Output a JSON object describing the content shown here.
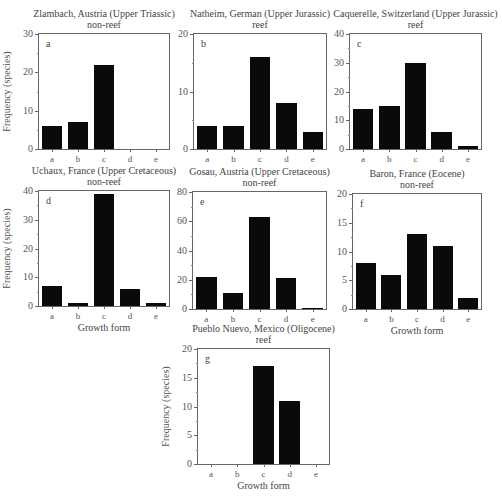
{
  "chart_data": [
    {
      "id": "a",
      "type": "bar",
      "title": "Zlambach, Austria (Upper Triassic)",
      "subtitle": "non-reef",
      "panel_label": "a",
      "categories": [
        "a",
        "b",
        "c",
        "d",
        "e"
      ],
      "values": [
        6,
        7,
        22,
        0,
        0
      ],
      "ylim": [
        0,
        30
      ],
      "yticks": [
        0,
        10,
        20,
        30
      ],
      "minor_step": 5,
      "xlabel": "",
      "ylabel": "Frequency (species)",
      "box": {
        "left": 38,
        "top": 33,
        "width": 132,
        "height": 117
      }
    },
    {
      "id": "b",
      "type": "bar",
      "title": "Natheim, German (Upper Jurassic)",
      "subtitle": "reef",
      "panel_label": "b",
      "categories": [
        "a",
        "b",
        "c",
        "d",
        "e"
      ],
      "values": [
        4,
        4,
        16,
        8,
        3
      ],
      "ylim": [
        0,
        20
      ],
      "yticks": [
        0,
        10,
        20
      ],
      "minor_step": 5,
      "xlabel": "",
      "ylabel": "",
      "box": {
        "left": 193,
        "top": 33,
        "width": 134,
        "height": 117
      }
    },
    {
      "id": "c",
      "type": "bar",
      "title": "Caquerelle, Switzerland (Upper Jurassic)",
      "subtitle": "reef",
      "panel_label": "c",
      "categories": [
        "a",
        "b",
        "c",
        "d",
        "e"
      ],
      "values": [
        14,
        15,
        30,
        6,
        1
      ],
      "ylim": [
        0,
        40
      ],
      "yticks": [
        0,
        10,
        20,
        30,
        40
      ],
      "minor_step": 5,
      "xlabel": "",
      "ylabel": "",
      "box": {
        "left": 349,
        "top": 33,
        "width": 133,
        "height": 117
      }
    },
    {
      "id": "d",
      "type": "bar",
      "title": "Uchaux, France (Upper Cretaceous)",
      "subtitle": "non-reef",
      "panel_label": "d",
      "categories": [
        "a",
        "b",
        "c",
        "d",
        "e"
      ],
      "values": [
        7,
        1,
        39,
        6,
        1
      ],
      "ylim": [
        0,
        40
      ],
      "yticks": [
        0,
        10,
        20,
        30,
        40
      ],
      "minor_step": 5,
      "xlabel": "Growth form",
      "ylabel": "Frequency (species)",
      "box": {
        "left": 38,
        "top": 190,
        "width": 132,
        "height": 117
      }
    },
    {
      "id": "e",
      "type": "bar",
      "title": "Gosau, Austria (Upper Cretaceous)",
      "subtitle": "non-reef",
      "panel_label": "e",
      "categories": [
        "a",
        "b",
        "c",
        "d",
        "e"
      ],
      "values": [
        22,
        11,
        63,
        21,
        1
      ],
      "ylim": [
        0,
        80
      ],
      "yticks": [
        0,
        20,
        40,
        60,
        80
      ],
      "minor_step": 10,
      "xlabel": "",
      "ylabel": "",
      "box": {
        "left": 192,
        "top": 191,
        "width": 135,
        "height": 119
      }
    },
    {
      "id": "f",
      "type": "bar",
      "title": "Baron, France (Eocene)",
      "subtitle": "non-reef",
      "panel_label": "f",
      "categories": [
        "a",
        "b",
        "c",
        "d",
        "e"
      ],
      "values": [
        8,
        6,
        13,
        11,
        2
      ],
      "ylim": [
        0,
        20
      ],
      "yticks": [
        0,
        5,
        10,
        15,
        20
      ],
      "minor_step": 2.5,
      "xlabel": "Growth form",
      "ylabel": "",
      "box": {
        "left": 352,
        "top": 193,
        "width": 130,
        "height": 117
      }
    },
    {
      "id": "g",
      "type": "bar",
      "title": "Pueblo Nuevo, Mexico (Oligocene)",
      "subtitle": "reef",
      "panel_label": "g",
      "categories": [
        "a",
        "b",
        "c",
        "d",
        "e"
      ],
      "values": [
        0,
        0,
        17,
        11,
        0
      ],
      "ylim": [
        0,
        20
      ],
      "yticks": [
        0,
        5,
        10,
        15,
        20
      ],
      "minor_step": 2.5,
      "xlabel": "Growth form",
      "ylabel": "Frequency (species)",
      "box": {
        "left": 197,
        "top": 348,
        "width": 133,
        "height": 117
      }
    }
  ],
  "colors": {
    "bar": "#0a0a0a",
    "axis": "#666666",
    "text": "#444444"
  }
}
